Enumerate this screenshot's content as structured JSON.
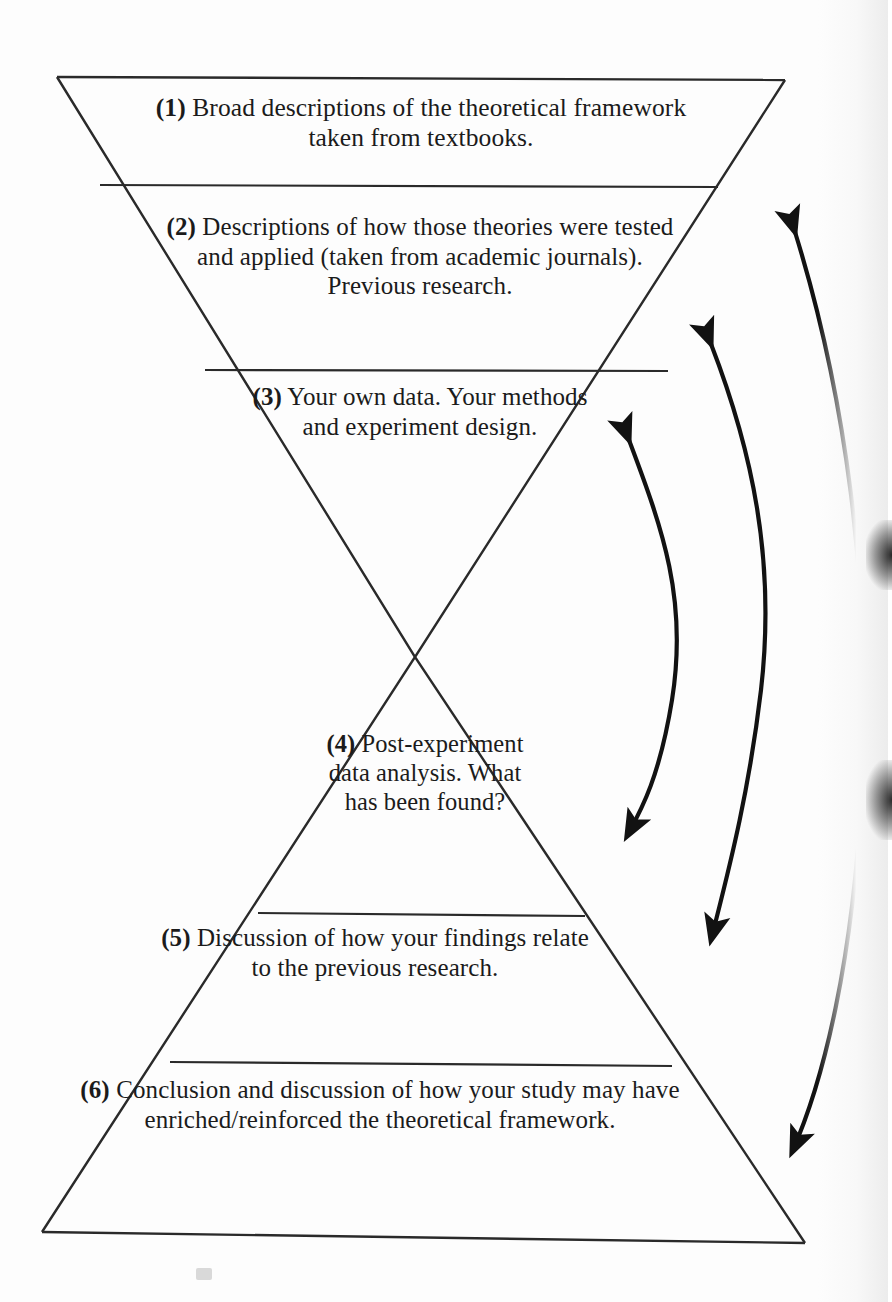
{
  "figure": {
    "name": "hourglass-research-structure-diagram",
    "shape": "hourglass",
    "ink_color": "#1b1b1b",
    "background_color": "#ffffff",
    "sections": [
      {
        "number": "(1)",
        "text": "Broad descriptions of the theoretical framework taken from textbooks.",
        "lines": [
          "Broad descriptions of the theoretical",
          "framework taken from textbooks."
        ]
      },
      {
        "number": "(2)",
        "text": "Descriptions of how those theories were tested and applied (taken from academic journals). Previous research.",
        "lines": [
          "Descriptions of how those theories",
          "were tested and applied (taken",
          "from academic journals).",
          "Previous research."
        ]
      },
      {
        "number": "(3)",
        "text": "Your own data. Your methods and experiment design.",
        "lines": [
          "Your own data.",
          "Your methods",
          "and experiment",
          "design."
        ]
      },
      {
        "number": "(4)",
        "text": "Post-experiment data analysis. What has been found?",
        "lines": [
          "Post-",
          "experiment",
          "data analysis.",
          "What has been",
          "found?"
        ]
      },
      {
        "number": "(5)",
        "text": "Discussion of how your findings relate to the previous research.",
        "lines": [
          "Discussion of how your",
          "findings relate to the previous",
          "research."
        ]
      },
      {
        "number": "(6)",
        "text": "Conclusion and discussion of how your study may have enriched/reinforced the theoretical framework.",
        "lines": [
          "Conclusion and discussion of how",
          "your study may have enriched/reinforced",
          "the theoretical framework."
        ]
      }
    ],
    "arrows": [
      {
        "name": "arrow-section3-to-section4",
        "style": "curved double-headed",
        "heads": "both",
        "connects": [
          "(3)",
          "(4)"
        ]
      },
      {
        "name": "arrow-section2-to-section5",
        "style": "curved double-headed",
        "heads": "both",
        "connects": [
          "(2)",
          "(5)"
        ]
      },
      {
        "name": "arrow-section1-to-section6",
        "style": "curved double-headed",
        "heads": "both",
        "connects": [
          "(1)",
          "(6)"
        ]
      }
    ]
  }
}
